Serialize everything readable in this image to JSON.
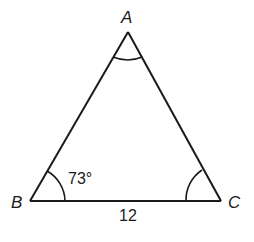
{
  "diagram": {
    "type": "triangle",
    "vertices": [
      {
        "label": "A",
        "x": 128,
        "y": 32
      },
      {
        "label": "B",
        "x": 30,
        "y": 201
      },
      {
        "label": "C",
        "x": 221,
        "y": 201
      }
    ],
    "angle_marks": [
      {
        "vertex": "A",
        "style": "single-arc"
      },
      {
        "vertex": "B",
        "style": "single-arc",
        "label": "73°"
      },
      {
        "vertex": "C",
        "style": "single-arc"
      }
    ],
    "sides": [
      {
        "between": [
          "B",
          "C"
        ],
        "label": "12"
      }
    ],
    "labels": {
      "A": "A",
      "B": "B",
      "C": "C",
      "angle_B": "73°",
      "side_BC": "12"
    },
    "stroke_color": "#1a1a1a"
  }
}
